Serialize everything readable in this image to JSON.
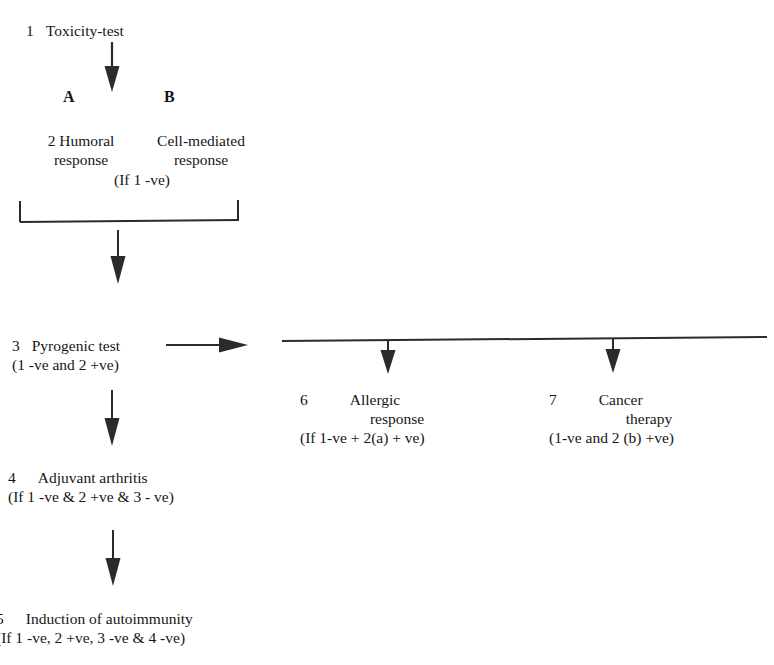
{
  "diagram": {
    "title_node": {
      "number": "1",
      "label": "Toxicity-test"
    },
    "branch_letters": {
      "a": "A",
      "b": "B"
    },
    "node2": {
      "number": "2",
      "left_line1": "Humoral",
      "left_line2": "response",
      "right_line1": "Cell-mediated",
      "right_line2": "response",
      "condition": "(If 1 -ve)"
    },
    "node3": {
      "number": "3",
      "label": "Pyrogenic test",
      "condition": "(1 -ve and 2 +ve)"
    },
    "node4": {
      "number": "4",
      "label": "Adjuvant arthritis",
      "condition": "(If 1 -ve & 2 +ve & 3 - ve)"
    },
    "node5": {
      "number": "5",
      "label": "Induction of autoimmunity",
      "condition": "(If 1 -ve, 2 +ve, 3 -ve & 4 -ve)"
    },
    "node6": {
      "number": "6",
      "label_line1": "Allergic",
      "label_line2": "response",
      "condition": "(If 1-ve + 2(a) + ve)"
    },
    "node7": {
      "number": "7",
      "label_line1": "Cancer",
      "label_line2": "therapy",
      "condition": "(1-ve and 2 (b) +ve)"
    },
    "colors": {
      "ink": "#1a1a1a",
      "line": "#2b2b2b",
      "background": "#ffffff"
    }
  }
}
